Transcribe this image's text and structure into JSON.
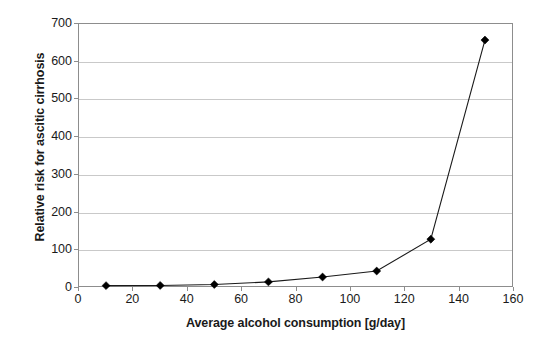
{
  "chart_data": {
    "type": "line",
    "title": "",
    "xlabel": "Average alcohol consumption [g/day]",
    "ylabel": "Relative risk for ascitic cirrhosis",
    "x": [
      10,
      30,
      50,
      70,
      90,
      110,
      130,
      150
    ],
    "values": [
      1,
      1.5,
      4,
      11,
      24,
      40,
      125,
      657
    ],
    "series": [
      {
        "name": "Relative risk for ascitic cirrhosis",
        "x": [
          10,
          30,
          50,
          70,
          90,
          110,
          130,
          150
        ],
        "values": [
          1,
          1.5,
          4,
          11,
          24,
          40,
          125,
          657
        ]
      }
    ],
    "xlim": [
      0,
      160
    ],
    "ylim": [
      0,
      700
    ],
    "xticks": [
      0,
      20,
      40,
      60,
      80,
      100,
      120,
      140,
      160
    ],
    "yticks": [
      0,
      100,
      200,
      300,
      400,
      500,
      600,
      700
    ],
    "xtick_labels": [
      "0",
      "20",
      "40",
      "60",
      "80",
      "100",
      "120",
      "140",
      "160"
    ],
    "ytick_labels": [
      "0",
      "100",
      "200",
      "300",
      "400",
      "500",
      "600",
      "700"
    ],
    "grid": "horizontal",
    "legend": "none",
    "marker": "diamond",
    "line_color": "#1a1a1a",
    "marker_color": "#000000",
    "grid_color": "#c9c9c9",
    "frame_color": "#8d8d8d",
    "background_color": "#ffffff"
  }
}
